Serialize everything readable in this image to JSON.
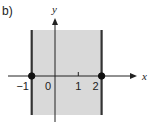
{
  "figure": {
    "part_label": "b)",
    "x_axis_label": "x",
    "y_axis_label": "y",
    "x_range": [
      -1.4,
      3.2
    ],
    "region": {
      "description": "vertical strip between two boundary lines",
      "x_from": -1,
      "x_to": 2,
      "fill_color": "#d9d9d9",
      "boundary_color": "#333333",
      "boundary_style": "solid",
      "endpoints": "closed"
    },
    "ticks": [
      {
        "value": -1,
        "label": "−1"
      },
      {
        "value": 0,
        "label": "0"
      },
      {
        "value": 1,
        "label": "1"
      },
      {
        "value": 2,
        "label": "2"
      }
    ],
    "points": [
      {
        "x": -1,
        "y": 0,
        "style": "filled"
      },
      {
        "x": 2,
        "y": 0,
        "style": "filled"
      }
    ]
  }
}
